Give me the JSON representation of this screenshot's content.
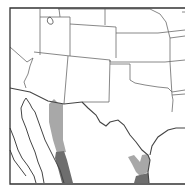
{
  "map": {
    "type": "range-map",
    "region": "Southwestern United States and northern Mexico",
    "colors": {
      "background": "#ffffff",
      "frame": "#333333",
      "state_border": "#6a6a6a",
      "international_border": "#444444",
      "range_light": "#a8a8a8",
      "range_dark": "#6e6e6e"
    },
    "range_areas": [
      {
        "name": "western-range-band",
        "shade": "light"
      },
      {
        "name": "western-range-band-south",
        "shade": "dark"
      },
      {
        "name": "eastern-range-patch",
        "shade": "light"
      },
      {
        "name": "eastern-range-patch-south",
        "shade": "dark"
      }
    ]
  }
}
